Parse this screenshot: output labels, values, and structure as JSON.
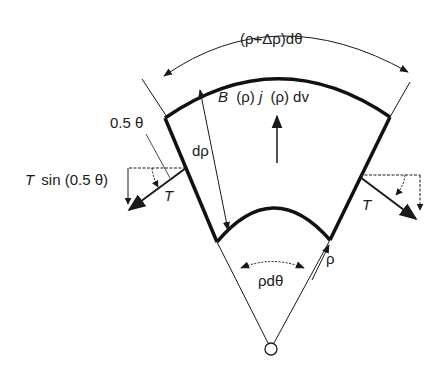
{
  "diagram": {
    "labels": {
      "outer_arc_length": "(ρ+Δρ)dθ",
      "body_force_B": "B",
      "body_force_rest": "(ρ)",
      "body_force_j": "j",
      "body_force_tail": "(ρ) dv",
      "radial_thickness": "dρ",
      "half_angle": "0.5 θ",
      "tension_component_T": "T",
      "tension_component_rest": "sin (0.5 θ)",
      "tension_left": "T",
      "tension_right": "T",
      "inner_radius": "ρ",
      "inner_arc_length": "ρdθ"
    },
    "colors": {
      "ink": "#1a1a1a",
      "background": "#ffffff"
    }
  }
}
